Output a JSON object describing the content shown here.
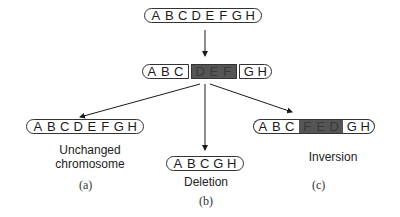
{
  "diagram": {
    "original": {
      "genes": [
        "A",
        "B",
        "C",
        "D",
        "E",
        "F",
        "G",
        "H"
      ]
    },
    "breaks": {
      "left": [
        "A",
        "B",
        "C"
      ],
      "middle": [
        "D",
        "E",
        "F"
      ],
      "right": [
        "G",
        "H"
      ]
    },
    "outcomes": [
      {
        "id": "a",
        "genes": [
          "A",
          "B",
          "C",
          "D",
          "E",
          "F",
          "G",
          "H"
        ],
        "label_line1": "Unchanged",
        "label_line2": "chromosome",
        "tag": "(a)"
      },
      {
        "id": "b",
        "genes": [
          "A",
          "B",
          "C",
          "G",
          "H"
        ],
        "label_line1": "Deletion",
        "tag": "(b)"
      },
      {
        "id": "c",
        "left": [
          "A",
          "B",
          "C"
        ],
        "middle": [
          "F",
          "E",
          "D"
        ],
        "right": [
          "G",
          "H"
        ],
        "label_line1": "Inversion",
        "tag": "(c)"
      }
    ],
    "colors": {
      "segment_fill": "#555555",
      "outline": "#333333"
    }
  }
}
